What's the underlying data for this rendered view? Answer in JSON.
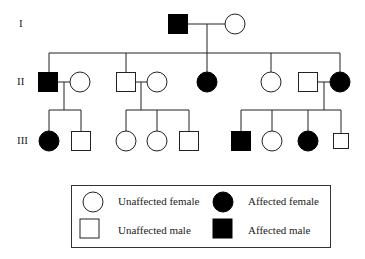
{
  "generations": [
    {
      "label": "I",
      "y": 24
    },
    {
      "label": "II",
      "y": 82
    },
    {
      "label": "III",
      "y": 141
    }
  ],
  "individuals": [
    {
      "id": "I-1",
      "gen": "I",
      "sex": "male",
      "affected": true,
      "x": 178,
      "y": 24
    },
    {
      "id": "I-2",
      "gen": "I",
      "sex": "female",
      "affected": false,
      "x": 235,
      "y": 24
    },
    {
      "id": "II-1",
      "gen": "II",
      "sex": "male",
      "affected": true,
      "x": 48,
      "y": 82
    },
    {
      "id": "II-2",
      "gen": "II",
      "sex": "female",
      "affected": false,
      "x": 80,
      "y": 82
    },
    {
      "id": "II-3",
      "gen": "II",
      "sex": "male",
      "affected": false,
      "x": 126,
      "y": 82
    },
    {
      "id": "II-4",
      "gen": "II",
      "sex": "female",
      "affected": false,
      "x": 157,
      "y": 82
    },
    {
      "id": "II-5",
      "gen": "II",
      "sex": "female",
      "affected": true,
      "x": 207,
      "y": 82
    },
    {
      "id": "II-6",
      "gen": "II",
      "sex": "female",
      "affected": false,
      "x": 271,
      "y": 82
    },
    {
      "id": "II-7",
      "gen": "II",
      "sex": "male",
      "affected": false,
      "x": 308,
      "y": 82
    },
    {
      "id": "II-8",
      "gen": "II",
      "sex": "female",
      "affected": true,
      "x": 340,
      "y": 82
    },
    {
      "id": "III-1",
      "gen": "III",
      "sex": "female",
      "affected": true,
      "x": 49,
      "y": 141
    },
    {
      "id": "III-2",
      "gen": "III",
      "sex": "male",
      "affected": false,
      "x": 81,
      "y": 141
    },
    {
      "id": "III-3",
      "gen": "III",
      "sex": "female",
      "affected": false,
      "x": 126,
      "y": 141
    },
    {
      "id": "III-4",
      "gen": "III",
      "sex": "female",
      "affected": false,
      "x": 157,
      "y": 141
    },
    {
      "id": "III-5",
      "gen": "III",
      "sex": "male",
      "affected": false,
      "x": 189,
      "y": 141
    },
    {
      "id": "III-6",
      "gen": "III",
      "sex": "male",
      "affected": true,
      "x": 241,
      "y": 141
    },
    {
      "id": "III-7",
      "gen": "III",
      "sex": "female",
      "affected": false,
      "x": 272,
      "y": 141
    },
    {
      "id": "III-8",
      "gen": "III",
      "sex": "female",
      "affected": true,
      "x": 308,
      "y": 141
    },
    {
      "id": "III-9",
      "gen": "III",
      "sex": "male",
      "affected": false,
      "x": 341,
      "y": 141,
      "small": true
    }
  ],
  "lines": [
    [
      188,
      24,
      225,
      24
    ],
    [
      207,
      24,
      207,
      53
    ],
    [
      49,
      53,
      340,
      53
    ],
    [
      49,
      53,
      49,
      72
    ],
    [
      126,
      53,
      126,
      72
    ],
    [
      207,
      53,
      207,
      72
    ],
    [
      271,
      53,
      271,
      72
    ],
    [
      340,
      53,
      340,
      72
    ],
    [
      58,
      82,
      70,
      82
    ],
    [
      64,
      82,
      64,
      110
    ],
    [
      49,
      110,
      81,
      110
    ],
    [
      49,
      110,
      49,
      131
    ],
    [
      81,
      110,
      81,
      131
    ],
    [
      136,
      82,
      147,
      82
    ],
    [
      141,
      82,
      141,
      110
    ],
    [
      126,
      110,
      189,
      110
    ],
    [
      126,
      110,
      126,
      131
    ],
    [
      157,
      110,
      157,
      131
    ],
    [
      189,
      110,
      189,
      131
    ],
    [
      318,
      82,
      330,
      82
    ],
    [
      324,
      82,
      324,
      110
    ],
    [
      241,
      110,
      341,
      110
    ],
    [
      241,
      110,
      241,
      131
    ],
    [
      272,
      110,
      272,
      131
    ],
    [
      308,
      110,
      308,
      131
    ],
    [
      341,
      110,
      341,
      133
    ]
  ],
  "legend": {
    "items": [
      {
        "symbol": "circle-open",
        "label": "Unaffected female"
      },
      {
        "symbol": "circle-filled",
        "label": "Affected female"
      },
      {
        "symbol": "square-open",
        "label": "Unaffected male"
      },
      {
        "symbol": "square-filled",
        "label": "Affected male"
      }
    ]
  },
  "colors": {
    "stroke": "#222222",
    "fill_affected": "#000000",
    "fill_unaffected": "#ffffff"
  }
}
